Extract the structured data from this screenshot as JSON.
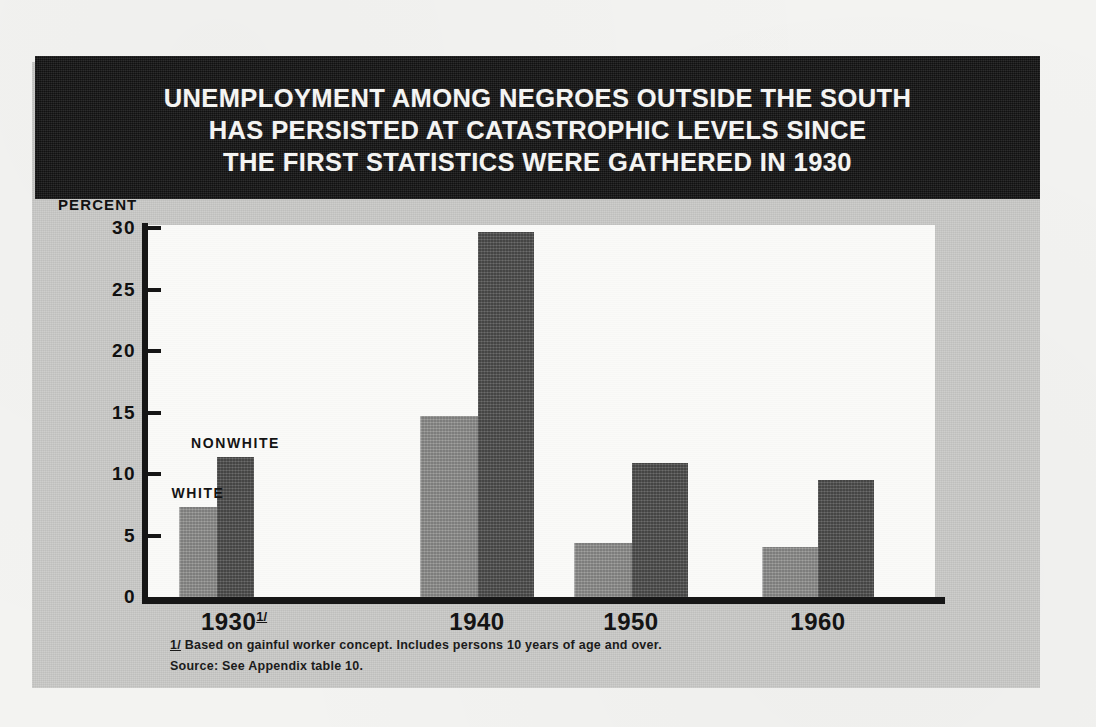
{
  "figure": {
    "title_lines": [
      "UNEMPLOYMENT AMONG NEGROES OUTSIDE THE SOUTH",
      "HAS PERSISTED AT CATASTROPHIC LEVELS SINCE",
      "THE FIRST STATISTICS WERE GATHERED IN 1930"
    ],
    "axis_unit_label": "PERCENT",
    "footnotes": [
      {
        "marker": "1/",
        "text": " Based on gainful worker concept.  Includes persons 10 years of age and over."
      },
      {
        "marker": "",
        "text": "Source: See Appendix table 10."
      }
    ],
    "series_annotations": [
      {
        "label": "WHITE"
      },
      {
        "label": "NONWHITE"
      }
    ],
    "colors": {
      "plate_background": "#c9c9c7",
      "title_band": "#1d1d1d",
      "title_text": "#f4f4f2",
      "plot_background": "#fafaf8",
      "axis": "#161616",
      "bar_white": "#8e8e8c",
      "bar_nonwhite": "#575756",
      "page": "#f3f3f1"
    }
  },
  "chart_data": {
    "type": "bar",
    "title": "UNEMPLOYMENT AMONG NEGROES OUTSIDE THE SOUTH HAS PERSISTED AT CATASTROPHIC LEVELS SINCE THE FIRST STATISTICS WERE GATHERED IN 1930",
    "xlabel": "",
    "ylabel": "PERCENT",
    "ylim": [
      0,
      30
    ],
    "yticks": [
      0,
      5,
      10,
      15,
      20,
      25,
      30
    ],
    "ytick_labels": [
      "0",
      "5",
      "10",
      "15",
      "20",
      "25",
      "30"
    ],
    "grid": false,
    "legend": "inline labels above first group",
    "categories": [
      "1930",
      "1940",
      "1950",
      "1960"
    ],
    "category_labels": [
      "1930 1/",
      "1940",
      "1950",
      "1960"
    ],
    "category_footnote_markers": [
      "1/",
      "",
      "",
      ""
    ],
    "series": [
      {
        "name": "WHITE",
        "values": [
          7.3,
          14.7,
          4.4,
          4.1
        ]
      },
      {
        "name": "NONWHITE",
        "values": [
          11.4,
          29.7,
          10.9,
          9.5
        ]
      }
    ]
  }
}
